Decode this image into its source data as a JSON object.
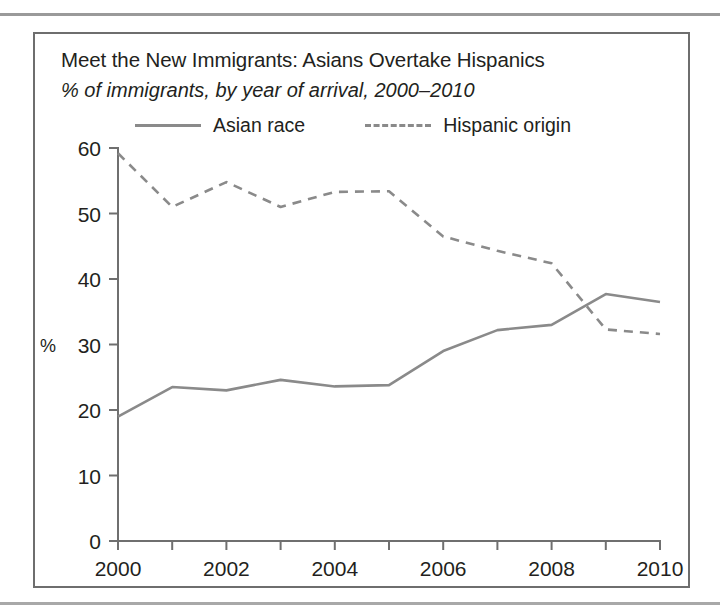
{
  "page": {
    "background": "#ffffff",
    "rule_color": "#9a9a9a",
    "border_color": "#6e6e6e"
  },
  "figure": {
    "title": "Meet the New Immigrants: Asians Overtake Hispanics",
    "subtitle": "% of immigrants, by year of arrival, 2000–2010"
  },
  "legend": {
    "items": [
      {
        "label": "Asian race",
        "style": "solid",
        "color": "#8a8a8a"
      },
      {
        "label": "Hispanic origin",
        "style": "dashed",
        "color": "#8a8a8a"
      }
    ]
  },
  "chart_data": {
    "type": "line",
    "title": "Meet the New Immigrants: Asians Overtake Hispanics",
    "subtitle": "% of immigrants, by year of arrival, 2000–2010",
    "xlabel": "",
    "ylabel": "%",
    "x": [
      2000,
      2001,
      2002,
      2003,
      2004,
      2005,
      2006,
      2007,
      2008,
      2009,
      2010
    ],
    "categories": [
      "2000",
      "2001",
      "2002",
      "2003",
      "2004",
      "2005",
      "2006",
      "2007",
      "2008",
      "2009",
      "2010"
    ],
    "xtick_labels": [
      "2000",
      "2002",
      "2004",
      "2006",
      "2008",
      "2010"
    ],
    "xtick_values": [
      2000,
      2002,
      2004,
      2006,
      2008,
      2010
    ],
    "ytick_labels": [
      "0",
      "10",
      "20",
      "30",
      "40",
      "50",
      "60"
    ],
    "ytick_values": [
      0,
      10,
      20,
      30,
      40,
      50,
      60
    ],
    "xlim": [
      2000,
      2010
    ],
    "ylim": [
      0,
      60
    ],
    "grid": false,
    "legend_position": "top",
    "series": [
      {
        "name": "Asian race",
        "style": "solid",
        "color": "#8a8a8a",
        "values": [
          19.0,
          23.5,
          23.0,
          24.6,
          23.6,
          23.8,
          29.0,
          32.2,
          33.0,
          37.7,
          36.5
        ]
      },
      {
        "name": "Hispanic origin",
        "style": "dashed",
        "color": "#8a8a8a",
        "values": [
          59.2,
          51.0,
          54.8,
          51.0,
          53.3,
          53.4,
          46.5,
          44.3,
          42.4,
          32.3,
          31.6
        ]
      }
    ]
  },
  "plot_geometry": {
    "x0": 118,
    "x1": 660,
    "y0": 541,
    "y1": 148
  }
}
